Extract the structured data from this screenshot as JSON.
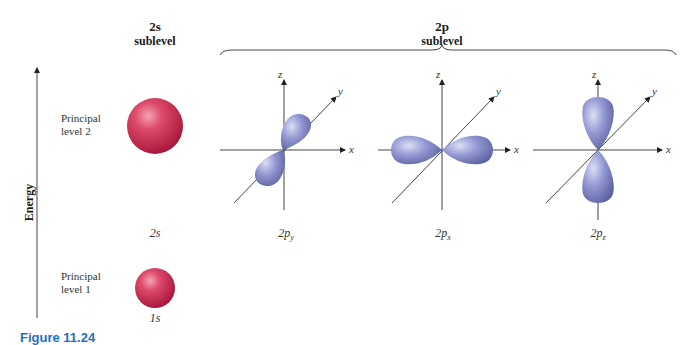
{
  "figure": {
    "caption_label": "Figure 11.24",
    "energy_axis_label": "Energy",
    "headers": {
      "s": {
        "symbol": "2s",
        "sub": "sublevel"
      },
      "p": {
        "symbol": "2p",
        "sub": "sublevel"
      }
    },
    "levels": [
      {
        "name": "level-2",
        "line1": "Principal",
        "line2": "level 2"
      },
      {
        "name": "level-1",
        "line1": "Principal",
        "line2": "level 1"
      }
    ],
    "orbitals": [
      {
        "id": "2s",
        "label": "2s",
        "shape": "sphere",
        "color": "#d23a5a"
      },
      {
        "id": "1s",
        "label": "1s",
        "shape": "sphere",
        "color": "#d23a5a"
      },
      {
        "id": "2py",
        "label_main": "2p",
        "label_sub": "y",
        "shape": "dumbbell-y",
        "color": "#8b90cc"
      },
      {
        "id": "2px",
        "label_main": "2p",
        "label_sub": "x",
        "shape": "dumbbell-x",
        "color": "#8b90cc"
      },
      {
        "id": "2pz",
        "label_main": "2p",
        "label_sub": "z",
        "shape": "dumbbell-z",
        "color": "#8b90cc"
      }
    ],
    "axes": {
      "x": "x",
      "y": "y",
      "z": "z"
    },
    "colors": {
      "s_orbital": "#d23a5a",
      "p_orbital": "#8b90cc",
      "caption": "#1f6fc0"
    }
  }
}
